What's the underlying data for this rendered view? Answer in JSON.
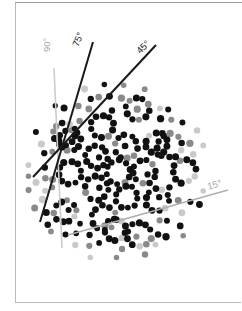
{
  "figure": {
    "title": "",
    "background_color": "#ffffff",
    "frame_color": "#b9b9b9",
    "width": 242,
    "height": 311
  },
  "chart_data": {
    "type": "scatter",
    "title": "",
    "subtitle": "",
    "xlabel": "",
    "ylabel": "",
    "grid": false,
    "legend_position": "none",
    "xlim": [
      0,
      242
    ],
    "ylim": [
      0,
      311
    ],
    "angle_lines": [
      {
        "label": "90°",
        "angle_deg": 90,
        "color": "#cccccc",
        "stroke_width": 1.6,
        "x1": 54,
        "y1": 68,
        "x2": 62,
        "y2": 248,
        "label_x": 41,
        "label_y": 52,
        "label_rotation": -90,
        "label_color": "#a6a6a6"
      },
      {
        "label": "75°",
        "angle_deg": 75,
        "color": "#1a1a1a",
        "stroke_width": 2.0,
        "x1": 93,
        "y1": 42,
        "x2": 40,
        "y2": 222,
        "label_x": 70,
        "label_y": 44,
        "label_rotation": -68,
        "label_color": "#1a1a1a"
      },
      {
        "label": "45°",
        "angle_deg": 45,
        "color": "#1a1a1a",
        "stroke_width": 2.0,
        "x1": 156,
        "y1": 45,
        "x2": 33,
        "y2": 177,
        "label_x": 134,
        "label_y": 48,
        "label_rotation": -45,
        "label_color": "#1a1a1a"
      },
      {
        "label": "15°",
        "angle_deg": 15,
        "color": "#b0b0b0",
        "stroke_width": 1.8,
        "x1": 68,
        "y1": 235,
        "x2": 228,
        "y2": 190,
        "label_x": 206,
        "label_y": 181,
        "label_rotation": -16,
        "label_color": "#a6a6a6"
      }
    ],
    "point_styles": {
      "dark": {
        "color": "#111111",
        "radius": 3.0
      },
      "mid": {
        "color": "#8a8a8a",
        "radius": 3.0
      },
      "light": {
        "color": "#c9c9c9",
        "radius": 3.0
      }
    },
    "pattern": {
      "kind": "penrose-like-dodecagonal",
      "center_x": 118,
      "center_y": 172,
      "outer_radius": 74,
      "ring_radius": 11.5,
      "ring_points": 10,
      "cluster_count": 19,
      "note": "clusters of dots arranged as decorated rings on a quasiperiodic lattice"
    }
  }
}
